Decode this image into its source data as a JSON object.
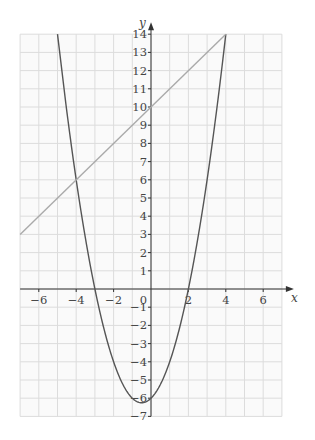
{
  "chart_data": {
    "type": "line",
    "title": "",
    "xlabel": "x",
    "ylabel": "y",
    "xlim": [
      -7,
      7
    ],
    "ylim": [
      -7,
      14
    ],
    "grid": true,
    "x_ticks": [
      -6,
      -4,
      -2,
      0,
      2,
      4,
      6
    ],
    "y_ticks": [
      14,
      13,
      12,
      11,
      10,
      9,
      8,
      7,
      6,
      5,
      4,
      3,
      2,
      1,
      -1,
      -2,
      -3,
      -4,
      -5,
      -6,
      -7
    ],
    "origin_label": "0",
    "series": [
      {
        "name": "y = x^2 + x - 6",
        "kind": "curve",
        "color": "#555555",
        "x": [
          -4.5,
          -4,
          -3.5,
          -3,
          -2.5,
          -2,
          -1.5,
          -1,
          -0.5,
          0,
          0.5,
          1,
          1.5,
          2,
          2.5,
          3,
          3.5,
          4
        ],
        "y": [
          9.75,
          6,
          2.75,
          0,
          -2.25,
          -4,
          -5.25,
          -6,
          -6.25,
          -6,
          -5.25,
          -4,
          -2.25,
          0,
          2.75,
          6,
          9.75,
          14
        ]
      },
      {
        "name": "y = x + 10",
        "kind": "line",
        "color": "#aaaaaa",
        "x": [
          -7,
          4
        ],
        "y": [
          3,
          14
        ]
      }
    ],
    "intersections": [
      [
        -4,
        6
      ],
      [
        4,
        14
      ]
    ]
  },
  "labels": {
    "x_axis": "x",
    "y_axis": "y",
    "origin": "0"
  }
}
